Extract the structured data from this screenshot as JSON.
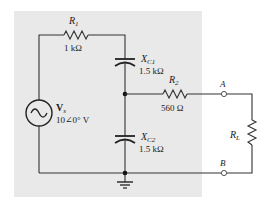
{
  "figure": {
    "background_panel_color": "#e9e9e9",
    "wire_color": "#333333"
  },
  "components": {
    "R1": {
      "symbol": "R",
      "subscript": "1",
      "value": "1 kΩ"
    },
    "XC1": {
      "symbol": "X",
      "subscript": "C1",
      "value": "1.5 kΩ"
    },
    "R2": {
      "symbol": "R",
      "subscript": "2",
      "value": "560 Ω"
    },
    "XC2": {
      "symbol": "X",
      "subscript": "C2",
      "value": "1.5 kΩ"
    },
    "Vs": {
      "symbol": "V",
      "subscript": "s",
      "value": "10∠0° V",
      "icon": "ac-source-icon"
    },
    "RL": {
      "symbol": "R",
      "subscript": "L"
    }
  },
  "terminals": {
    "A": "A",
    "B": "B"
  },
  "icons": {
    "ground": "ground-icon",
    "junction": "junction-dot"
  }
}
